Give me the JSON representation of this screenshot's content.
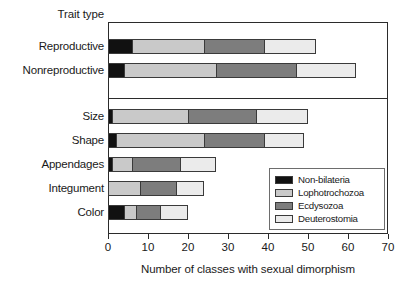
{
  "chart_data": {
    "type": "bar",
    "orientation": "horizontal",
    "stacked": true,
    "title": "",
    "ylabel": "Trait type",
    "xlabel": "Number of classes with sexual dimorphism",
    "xlim": [
      0,
      70
    ],
    "xticks": [
      0,
      10,
      20,
      30,
      40,
      50,
      60,
      70
    ],
    "grid": false,
    "legend_position": "lower right",
    "categories": [
      "Reproductive",
      "Nonreproductive",
      "Size",
      "Shape",
      "Appendages",
      "Integument",
      "Color"
    ],
    "category_groups": [
      {
        "name": "group-top",
        "categories": [
          "Reproductive",
          "Nonreproductive"
        ]
      },
      {
        "name": "group-bottom",
        "categories": [
          "Size",
          "Shape",
          "Appendages",
          "Integument",
          "Color"
        ]
      }
    ],
    "series": [
      {
        "name": "Non-bilateria",
        "color": "#111111",
        "values": [
          6,
          4,
          1,
          2,
          1,
          0,
          4
        ]
      },
      {
        "name": "Lophotrochozoa",
        "color": "#c9c9c9",
        "values": [
          18,
          23,
          19,
          22,
          5,
          8,
          3
        ]
      },
      {
        "name": "Ecdysozoa",
        "color": "#7d7d7d",
        "values": [
          15,
          20,
          17,
          15,
          12,
          9,
          6
        ]
      },
      {
        "name": "Deuterostomia",
        "color": "#ebebeb",
        "values": [
          13,
          15,
          13,
          10,
          9,
          7,
          7
        ]
      }
    ],
    "totals": [
      52,
      62,
      50,
      49,
      27,
      24,
      20
    ]
  },
  "legend": {
    "items": [
      {
        "label": "Non-bilateria",
        "color": "#111111"
      },
      {
        "label": "Lophotrochozoa",
        "color": "#c9c9c9"
      },
      {
        "label": "Ecdysozoa",
        "color": "#7d7d7d"
      },
      {
        "label": "Deuterostomia",
        "color": "#ebebeb"
      }
    ]
  },
  "axis": {
    "x_title": "Number of classes with sexual dimorphism",
    "y_title": "Trait type",
    "x_tick_labels": [
      "0",
      "10",
      "20",
      "30",
      "40",
      "50",
      "60",
      "70"
    ]
  }
}
